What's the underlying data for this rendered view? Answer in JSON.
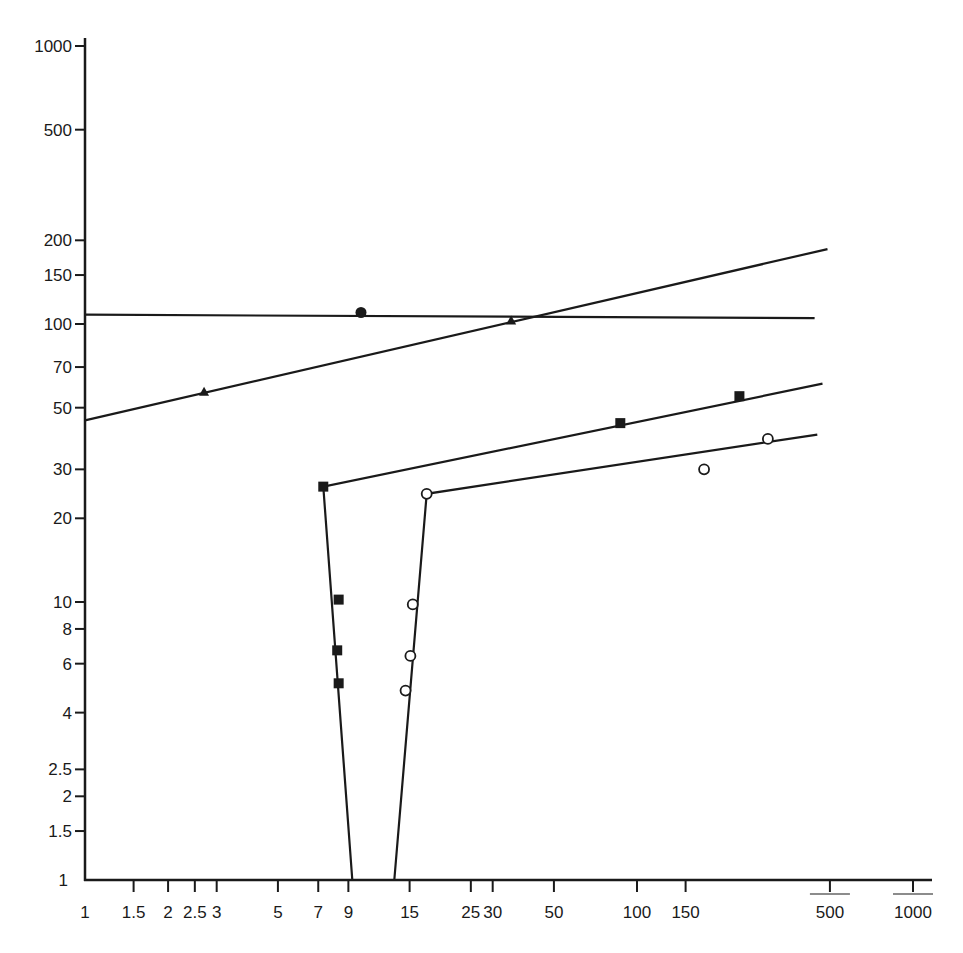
{
  "chart_data": {
    "type": "scatter",
    "title": "",
    "xlabel": "",
    "ylabel": "",
    "x_scale": "log",
    "y_scale": "log",
    "xlim": [
      1,
      1000
    ],
    "ylim": [
      1,
      1000
    ],
    "grid": false,
    "legend": null,
    "x_ticks": [
      1,
      1.5,
      2,
      2.5,
      3,
      5,
      7,
      9,
      15,
      25,
      30,
      50,
      100,
      150,
      500,
      1000
    ],
    "x_tick_labels": [
      "1",
      "1.5",
      "2",
      "2.5",
      "3",
      "5",
      "7",
      "9",
      "15",
      "25",
      "30",
      "50",
      "100",
      "150",
      "500",
      "1000"
    ],
    "y_ticks": [
      1,
      1.5,
      2,
      2.5,
      4,
      6,
      8,
      10,
      20,
      30,
      50,
      70,
      100,
      150,
      200,
      500,
      1000
    ],
    "y_tick_labels": [
      "1",
      "1.5",
      "2",
      "2.5",
      "4",
      "6",
      "8",
      "10",
      "20",
      "30",
      "50",
      "70",
      "100",
      "150",
      "200",
      "500",
      "1000"
    ],
    "series": [
      {
        "name": "filled-circle",
        "marker": "circle-filled",
        "points": [
          [
            10,
            110
          ]
        ],
        "fit_line": [
          [
            1,
            108
          ],
          [
            440,
            105
          ]
        ]
      },
      {
        "name": "filled-triangle",
        "marker": "triangle-filled",
        "points": [
          [
            2.7,
            57
          ],
          [
            35,
            103
          ]
        ],
        "fit_line": [
          [
            1,
            45
          ],
          [
            490,
            186
          ]
        ]
      },
      {
        "name": "filled-square",
        "marker": "square-filled",
        "points": [
          [
            7.3,
            26
          ],
          [
            8.3,
            10.2
          ],
          [
            8.2,
            6.7
          ],
          [
            8.3,
            5.1
          ],
          [
            87,
            44
          ],
          [
            235,
            55
          ]
        ],
        "fit_line": [
          [
            9.3,
            1
          ],
          [
            7.3,
            26
          ],
          [
            470,
            61
          ]
        ]
      },
      {
        "name": "open-circle",
        "marker": "circle-open",
        "points": [
          [
            17.3,
            24.5
          ],
          [
            15.4,
            9.8
          ],
          [
            15.1,
            6.4
          ],
          [
            14.5,
            4.8
          ],
          [
            175,
            30
          ],
          [
            298,
            38.6
          ]
        ],
        "fit_line": [
          [
            13.2,
            1
          ],
          [
            17.3,
            24.5
          ],
          [
            450,
            40
          ]
        ]
      }
    ]
  },
  "colors": {
    "ink": "#1a1a1a",
    "background": "#ffffff"
  }
}
